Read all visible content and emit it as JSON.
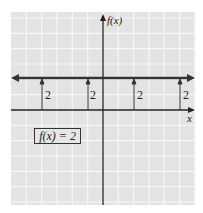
{
  "chart_data": {
    "type": "line",
    "title": "",
    "function_label": "f(x) = 2",
    "xlabel": "x",
    "ylabel": "f(x)",
    "series": [
      {
        "name": "f(x) = 2",
        "x": [
          -6,
          6
        ],
        "values": [
          2,
          2
        ],
        "style": "horizontal line with arrows both ends"
      }
    ],
    "annotations": [
      {
        "x": -4,
        "from": 0,
        "to": 2,
        "label": "2"
      },
      {
        "x": -1,
        "from": 0,
        "to": 2,
        "label": "2"
      },
      {
        "x": 2,
        "from": 0,
        "to": 2,
        "label": "2"
      },
      {
        "x": 5,
        "from": 0,
        "to": 2,
        "label": "2"
      }
    ],
    "grid": true,
    "xlim": [
      -6,
      6
    ],
    "ylim": [
      -6,
      6.5
    ],
    "legend_position": "none"
  },
  "labels": {
    "y_axis": "f(x)",
    "x_axis": "x",
    "box": "f(x) = 2",
    "tick": "2"
  },
  "colors": {
    "grid_bg": "#e3e3e3",
    "grid_line": "#f7f7f7",
    "axis": "#222222",
    "line": "#333333"
  }
}
